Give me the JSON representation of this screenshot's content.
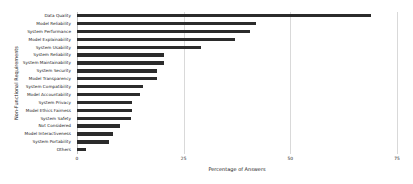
{
  "chart_data": {
    "type": "bar",
    "orientation": "horizontal",
    "title": "",
    "xlabel": "Percentage of Answers",
    "ylabel": "Non-Functional Requirements",
    "xlim": [
      0,
      75
    ],
    "xticks": [
      0,
      25,
      50,
      75
    ],
    "xtick_labels": [
      "0",
      "25",
      "50",
      "75"
    ],
    "grid": true,
    "grid_axis": "x",
    "legend": null,
    "bar_color": "#2b2b2b",
    "background_color": "#ffffff",
    "categories": [
      "Data Quality",
      "Model Reliability",
      "System Performance",
      "Model Explainability",
      "System Usability",
      "System Reliability",
      "System Maintainability",
      "System Security",
      "Model Transparency",
      "System Compatibility",
      "Model Accountability",
      "System Privacy",
      "Model Ethics Fairness",
      "System Safety",
      "Not Considered",
      "Model Interactiveness",
      "System Portability",
      "Others"
    ],
    "values": [
      69.0,
      42.0,
      40.5,
      37.0,
      29.0,
      20.5,
      20.5,
      18.7,
      18.7,
      15.5,
      14.8,
      13.0,
      13.0,
      12.6,
      10.0,
      8.4,
      7.5,
      2.2
    ]
  }
}
